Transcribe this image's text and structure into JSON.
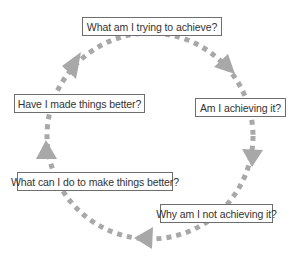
{
  "diagram": {
    "type": "cycle",
    "direction": "clockwise",
    "arrow_color": "#a8a8a8",
    "steps": [
      {
        "label": "What am I trying to achieve?"
      },
      {
        "label": "Am I achieving it?"
      },
      {
        "label": "Why am I not achieving it?"
      },
      {
        "label": "What can I do to make things better?"
      },
      {
        "label": "Have I made things better?"
      }
    ]
  }
}
